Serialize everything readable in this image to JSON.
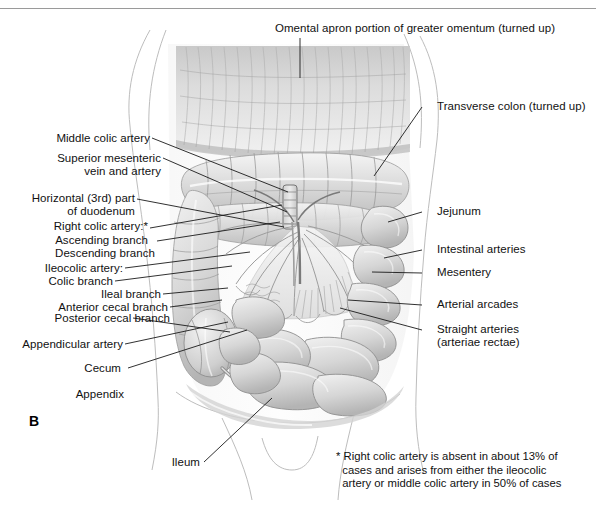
{
  "figure": {
    "panel_label": "B",
    "title_top": "Omental apron portion of greater omentum (turned up)",
    "footnote": "* Right colic artery is absent in about 13% of\n  cases and arises from either the ileocolic\n  artery or middle colic artery in 50% of cases",
    "background_color": "#ffffff",
    "ink_color": "#111111",
    "leader_color": "#1a1a1a",
    "outline_color": "#b9b9b9"
  },
  "labels_left": [
    {
      "id": "middle-colic-artery",
      "text": "Middle colic artery"
    },
    {
      "id": "superior-mesenteric",
      "text": "Superior mesenteric\nvein and artery"
    },
    {
      "id": "horizontal-duodenum",
      "text": "Horizontal (3rd) part\nof duodenum"
    },
    {
      "id": "right-colic-artery",
      "text": "Right colic artery:*"
    },
    {
      "id": "ascending-branch",
      "text": "Ascending branch"
    },
    {
      "id": "descending-branch",
      "text": "Descending branch"
    },
    {
      "id": "ileocolic-artery",
      "text": "Ileocolic artery:"
    },
    {
      "id": "colic-branch",
      "text": "Colic branch"
    },
    {
      "id": "ileal-branch",
      "text": "Ileal branch"
    },
    {
      "id": "anterior-cecal-branch",
      "text": "Anterior cecal branch"
    },
    {
      "id": "posterior-cecal-branch",
      "text": "Posterior cecal branch"
    },
    {
      "id": "appendicular-artery",
      "text": "Appendicular artery"
    },
    {
      "id": "cecum",
      "text": "Cecum"
    },
    {
      "id": "appendix",
      "text": "Appendix"
    },
    {
      "id": "ileum",
      "text": "Ileum"
    }
  ],
  "labels_right": [
    {
      "id": "transverse-colon",
      "text": "Transverse colon (turned up)"
    },
    {
      "id": "jejunum",
      "text": "Jejunum"
    },
    {
      "id": "intestinal-arteries",
      "text": "Intestinal arteries"
    },
    {
      "id": "mesentery",
      "text": "Mesentery"
    },
    {
      "id": "arterial-arcades",
      "text": "Arterial arcades"
    },
    {
      "id": "straight-arteries",
      "text": "Straight arteries\n(arteriae rectae)"
    }
  ]
}
